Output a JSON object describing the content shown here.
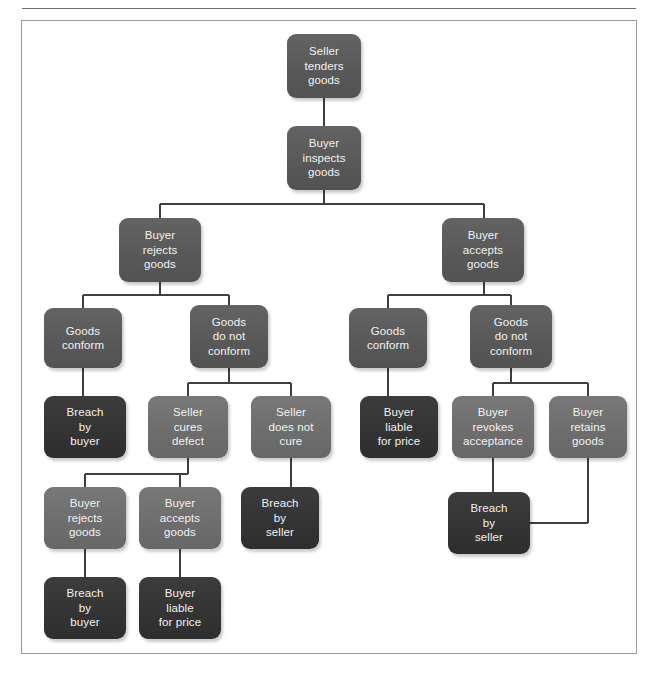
{
  "figure": {
    "frame_color": "#9a9aa0",
    "background": "#ffffff",
    "line_color": "#3f3f3f",
    "tones": {
      "mid": "#595959",
      "light": "#6e6e6e",
      "dark": "#343434"
    }
  },
  "chart_data": {
    "type": "diagram",
    "nodes": [
      {
        "id": "n1",
        "label": "Seller\ntenders\ngoods",
        "tone": "mid",
        "x": 287,
        "y": 34,
        "w": 74,
        "h": 64
      },
      {
        "id": "n2",
        "label": "Buyer\ninspects\ngoods",
        "tone": "mid",
        "x": 287,
        "y": 126,
        "w": 74,
        "h": 64
      },
      {
        "id": "n3",
        "label": "Buyer\nrejects\ngoods",
        "tone": "mid",
        "x": 119,
        "y": 218,
        "w": 82,
        "h": 64
      },
      {
        "id": "n4",
        "label": "Buyer\naccepts\ngoods",
        "tone": "mid",
        "x": 442,
        "y": 218,
        "w": 82,
        "h": 64
      },
      {
        "id": "n5",
        "label": "Goods\nconform",
        "tone": "mid",
        "x": 44,
        "y": 308,
        "w": 78,
        "h": 60
      },
      {
        "id": "n6",
        "label": "Goods\ndo not\nconform",
        "tone": "mid",
        "x": 190,
        "y": 305,
        "w": 78,
        "h": 63
      },
      {
        "id": "n7",
        "label": "Goods\nconform",
        "tone": "mid",
        "x": 349,
        "y": 308,
        "w": 78,
        "h": 60
      },
      {
        "id": "n8",
        "label": "Goods\ndo not\nconform",
        "tone": "mid",
        "x": 470,
        "y": 305,
        "w": 82,
        "h": 63
      },
      {
        "id": "n9",
        "label": "Breach\nby\nbuyer",
        "tone": "dark",
        "x": 44,
        "y": 396,
        "w": 82,
        "h": 62
      },
      {
        "id": "n10",
        "label": "Seller\ncures\ndefect",
        "tone": "light",
        "x": 148,
        "y": 396,
        "w": 80,
        "h": 62
      },
      {
        "id": "n11",
        "label": "Seller\ndoes not\ncure",
        "tone": "light",
        "x": 251,
        "y": 396,
        "w": 80,
        "h": 62
      },
      {
        "id": "n12",
        "label": "Buyer\nliable\nfor price",
        "tone": "dark",
        "x": 360,
        "y": 396,
        "w": 78,
        "h": 62
      },
      {
        "id": "n13",
        "label": "Buyer\nrevokes\nacceptance",
        "tone": "light",
        "x": 452,
        "y": 396,
        "w": 82,
        "h": 62
      },
      {
        "id": "n14",
        "label": "Buyer\nretains\ngoods",
        "tone": "light",
        "x": 549,
        "y": 396,
        "w": 78,
        "h": 62
      },
      {
        "id": "n15",
        "label": "Buyer\nrejects\ngoods",
        "tone": "light",
        "x": 44,
        "y": 487,
        "w": 82,
        "h": 62
      },
      {
        "id": "n16",
        "label": "Buyer\naccepts\ngoods",
        "tone": "light",
        "x": 139,
        "y": 487,
        "w": 82,
        "h": 62
      },
      {
        "id": "n17",
        "label": "Breach\nby\nseller",
        "tone": "dark",
        "x": 241,
        "y": 487,
        "w": 78,
        "h": 62
      },
      {
        "id": "n18",
        "label": "Breach\nby\nseller",
        "tone": "dark",
        "x": 448,
        "y": 492,
        "w": 82,
        "h": 62
      },
      {
        "id": "n19",
        "label": "Breach\nby\nbuyer",
        "tone": "dark",
        "x": 44,
        "y": 577,
        "w": 82,
        "h": 62
      },
      {
        "id": "n20",
        "label": "Buyer\nliable\nfor price",
        "tone": "dark",
        "x": 139,
        "y": 577,
        "w": 82,
        "h": 62
      }
    ],
    "edges": [
      {
        "from": "n1",
        "to": "n2",
        "kind": "vertical"
      },
      {
        "from": "n2",
        "to": [
          "n3",
          "n4"
        ],
        "kind": "split"
      },
      {
        "from": "n3",
        "to": [
          "n5",
          "n6"
        ],
        "kind": "split"
      },
      {
        "from": "n4",
        "to": [
          "n7",
          "n8"
        ],
        "kind": "split"
      },
      {
        "from": "n5",
        "to": "n9",
        "kind": "vertical"
      },
      {
        "from": "n6",
        "to": [
          "n10",
          "n11"
        ],
        "kind": "split"
      },
      {
        "from": "n7",
        "to": "n12",
        "kind": "vertical"
      },
      {
        "from": "n8",
        "to": [
          "n13",
          "n14"
        ],
        "kind": "split"
      },
      {
        "from": "n10",
        "to": [
          "n15",
          "n16"
        ],
        "kind": "split"
      },
      {
        "from": "n11",
        "to": "n17",
        "kind": "vertical"
      },
      {
        "from": "n13",
        "to": "n18",
        "kind": "vertical"
      },
      {
        "from": "n14",
        "to": "n18",
        "kind": "elbow-left"
      },
      {
        "from": "n15",
        "to": "n19",
        "kind": "vertical"
      },
      {
        "from": "n16",
        "to": "n20",
        "kind": "vertical"
      }
    ]
  }
}
